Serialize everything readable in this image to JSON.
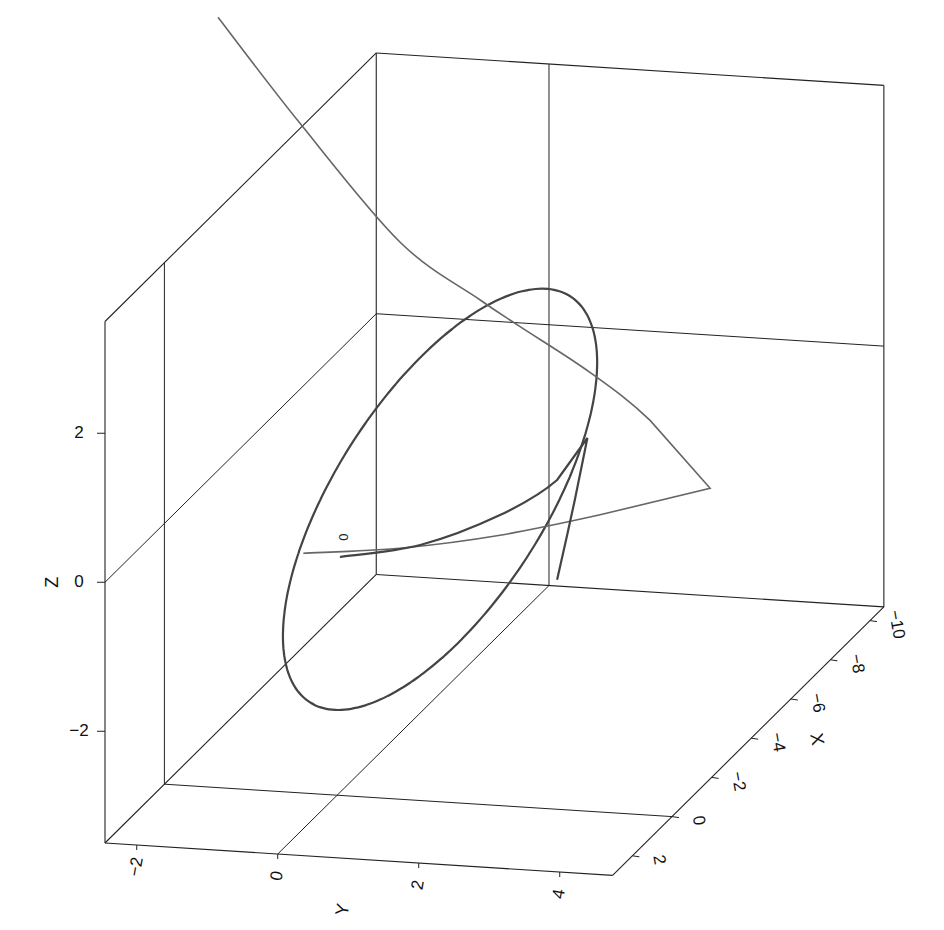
{
  "chart_data": {
    "type": "line",
    "projection": "3d",
    "title": "",
    "axes": {
      "x": {
        "label": "X",
        "range": [
          3.0,
          -10.7
        ],
        "ticks": [
          2,
          0,
          -2,
          -4,
          -6,
          -8,
          -10
        ],
        "tick_labels": [
          "2",
          "0",
          "−2",
          "−4",
          "−6",
          "−8",
          "−10"
        ]
      },
      "y": {
        "label": "Y",
        "range": [
          -2.45,
          4.75
        ],
        "ticks": [
          -2,
          0,
          2,
          4
        ],
        "tick_labels": [
          "−2",
          "0",
          "2",
          "4"
        ]
      },
      "z": {
        "label": "Z",
        "range": [
          -3.5,
          3.5
        ],
        "ticks": [
          -2,
          0,
          2
        ],
        "tick_labels": [
          "−2",
          "0",
          "2"
        ]
      }
    },
    "grid": {
      "planes": "back walls",
      "lines_at": {
        "x": 0,
        "y": 0,
        "z": 0
      }
    },
    "series": [
      {
        "name": "ellipse",
        "style": "dark",
        "kind": "parametric-ellipse",
        "center": [
          0,
          1.46,
          0.56
        ],
        "axis_a": [
          0,
          0.85,
          2.74
        ],
        "axis_b": [
          0,
          2.06,
          1.0
        ]
      },
      {
        "name": "thin-curve",
        "style": "thin",
        "points": [
          [
            0,
            -0.48,
            -0.28
          ],
          [
            0,
            0.89,
            -0.13
          ],
          [
            0,
            2.31,
            0.13
          ],
          [
            0,
            3.73,
            0.49
          ],
          [
            0,
            5.29,
            0.94
          ],
          [
            0,
            4.44,
            1.8
          ],
          [
            0,
            3.59,
            2.39
          ],
          [
            0,
            2.59,
            2.95
          ],
          [
            0,
            2.03,
            3.27
          ],
          [
            0,
            0.89,
            3.98
          ],
          [
            0,
            -0.53,
            5.49
          ],
          [
            0,
            -1.69,
            6.84
          ]
        ]
      },
      {
        "name": "cusp-curve",
        "style": "dark",
        "points": [
          [
            0,
            0.04,
            -0.3
          ],
          [
            0,
            1.18,
            -0.07
          ],
          [
            0,
            2.31,
            0.4
          ],
          [
            0,
            3.12,
            0.92
          ],
          [
            0,
            3.55,
            1.51
          ],
          [
            0,
            3.37,
            0.66
          ],
          [
            0,
            3.12,
            -0.42
          ]
        ]
      }
    ],
    "annotations": [
      {
        "text": "0",
        "at": [
          0,
          0.08,
          -0.03
        ]
      }
    ]
  }
}
